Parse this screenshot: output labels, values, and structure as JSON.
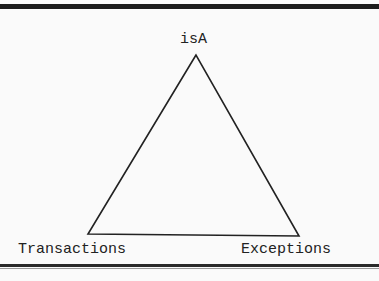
{
  "diagram": {
    "type": "triangle",
    "nodes": [
      {
        "id": "top",
        "label": "isA"
      },
      {
        "id": "bottom-left",
        "label": "Transactions"
      },
      {
        "id": "bottom-right",
        "label": "Exceptions"
      }
    ],
    "edges": [
      {
        "from": "top",
        "to": "bottom-left"
      },
      {
        "from": "top",
        "to": "bottom-right"
      },
      {
        "from": "bottom-left",
        "to": "bottom-right"
      }
    ],
    "colors": {
      "line": "#222222",
      "background": "#fafafa",
      "rule": "#1c1c1c"
    }
  }
}
